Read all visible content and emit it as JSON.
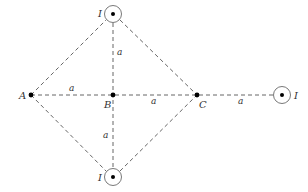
{
  "diagram": {
    "points": [
      {
        "id": "A",
        "label": "A",
        "x": 31,
        "y": 95
      },
      {
        "id": "B",
        "label": "B",
        "x": 113,
        "y": 95
      },
      {
        "id": "C",
        "label": "C",
        "x": 197,
        "y": 95
      }
    ],
    "currents": [
      {
        "id": "top",
        "label": "I",
        "direction": "out-of-page",
        "x": 113,
        "y": 14
      },
      {
        "id": "bottom",
        "label": "I",
        "direction": "out-of-page",
        "x": 113,
        "y": 177
      },
      {
        "id": "right",
        "label": "I",
        "direction": "out-of-page",
        "x": 282,
        "y": 95
      }
    ],
    "lengths": [
      {
        "segment": "A-B",
        "label": "a"
      },
      {
        "segment": "B-C",
        "label": "a"
      },
      {
        "segment": "C-right",
        "label": "a"
      },
      {
        "segment": "top-B",
        "label": "a"
      },
      {
        "segment": "B-bottom",
        "label": "a"
      }
    ],
    "colors": {
      "line": "#555555",
      "dot": "#000000",
      "text": "#333333"
    }
  }
}
